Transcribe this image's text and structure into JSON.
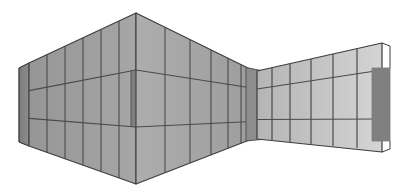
{
  "canvas": {
    "width": 403,
    "height": 192,
    "background": "#ffffff",
    "title": "Perspective rendering of a folded curtain-wall panel assembly"
  },
  "palette": {
    "outline": "#3c3c3c",
    "mullion": "#4a4a4a",
    "left_facet_a": "#9e9e9e",
    "left_facet_b": "#a8a8a8",
    "right_facet": "#c3c3c3",
    "right_facet_far": "#cfcfcf",
    "dark_return": "#808080",
    "dark_return_edge": "#7a7a7a",
    "inner_corner": "#8d8d8d",
    "sliver": "#b6b6b6",
    "background": "#ffffff"
  },
  "geometry": {
    "left_edge_x": 19,
    "left_edge_top_y": 68,
    "left_edge_bottom_y": 142,
    "convex_apex_x": 136,
    "convex_apex_top_y": 13,
    "convex_apex_bottom_y": 184,
    "concave_corner_x": 252,
    "concave_corner_top_y": 70,
    "concave_corner_bottom_y": 139,
    "right_edge_x": 382,
    "right_edge_top_y": 43,
    "right_edge_bottom_y": 152
  },
  "structure": {
    "panels": [
      {
        "name": "left-return-panel",
        "tone": "dark",
        "description": "Dark narrow vertical return panel at far left edge"
      },
      {
        "name": "left-facet-a",
        "tone": "medium",
        "bays": 5,
        "courses": 3,
        "description": "First facet of the left wall, receding from left edge to convex apex"
      },
      {
        "name": "convex-corner-return",
        "tone": "dark",
        "description": "Dark vertical band marking the convex (outward) corner column"
      },
      {
        "name": "left-facet-b",
        "tone": "medium-light",
        "bays": 6,
        "courses": 3,
        "description": "Second facet of the left wall, receding from convex apex to the concave corner"
      },
      {
        "name": "concave-corner-column",
        "tone": "dark",
        "description": "Dark vertical column at the concave (inward) corner where the two walls meet"
      },
      {
        "name": "right-facet",
        "tone": "light",
        "bays": 6,
        "courses": 3,
        "description": "Right wall plane, brightly lit, widening toward the right edge"
      },
      {
        "name": "right-return-panel",
        "tone": "dark",
        "description": "Dark vertical return panel at the far right edge"
      }
    ],
    "course_count": 3,
    "notes": "Two horizontal transom lines divide every facet into three vertical courses"
  },
  "labels": {
    "figure_caption": ""
  }
}
